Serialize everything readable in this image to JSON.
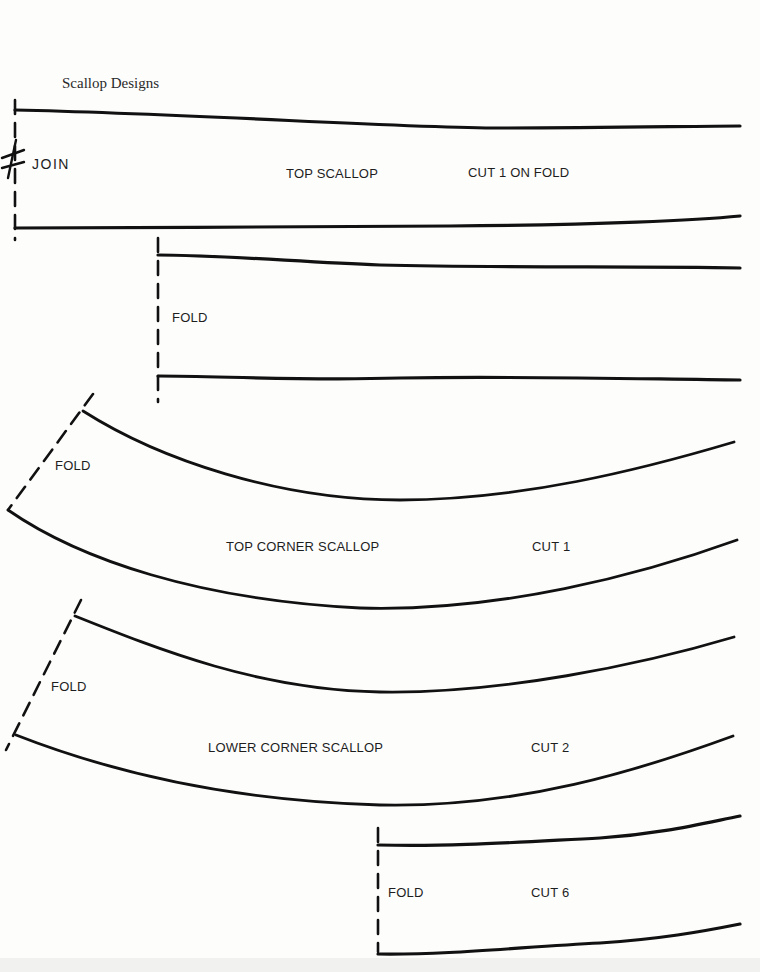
{
  "page": {
    "title": "Scallop Designs",
    "ink_color": "#111111",
    "paper_color": "#fdfdfc"
  },
  "pieces": [
    {
      "id": "top-scallop",
      "name": "TOP SCALLOP",
      "instruction": "CUT 1 ON FOLD",
      "edge_label": "JOIN",
      "edge_type": "join"
    },
    {
      "id": "top-scallop-fold",
      "name": "",
      "instruction": "",
      "edge_label": "FOLD",
      "edge_type": "fold"
    },
    {
      "id": "top-corner-scallop",
      "name": "TOP CORNER SCALLOP",
      "instruction": "CUT 1",
      "edge_label": "FOLD",
      "edge_type": "fold"
    },
    {
      "id": "lower-corner-scallop",
      "name": "LOWER CORNER SCALLOP",
      "instruction": "CUT 2",
      "edge_label": "FOLD",
      "edge_type": "fold"
    },
    {
      "id": "side-scallop",
      "name": "",
      "instruction": "CUT 6",
      "edge_label": "FOLD",
      "edge_type": "fold"
    }
  ]
}
